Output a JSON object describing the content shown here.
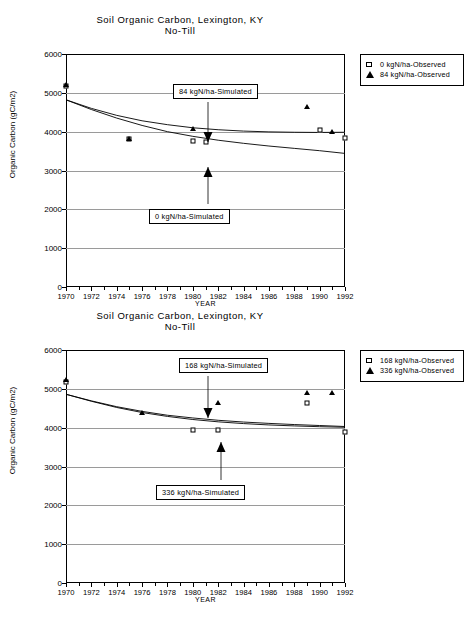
{
  "charts": [
    {
      "id": "chart-1",
      "title_line1": "Soil Organic Carbon,  Lexington,  KY",
      "title_line2": "No-Till",
      "legend": [
        {
          "key": "square",
          "label": "0 kgN/ha-Observed"
        },
        {
          "key": "triangle",
          "label": "84 kgN/ha-Observed"
        }
      ],
      "annotations": [
        {
          "text": "84 kgN/ha-Simulated",
          "direction": "down"
        },
        {
          "text": "0 kgN/ha-Simulated",
          "direction": "up"
        }
      ],
      "chart_data": {
        "type": "line",
        "title": "Soil Organic Carbon,  Lexington,  KY No-Till",
        "xlabel": "YEAR",
        "ylabel": "Organic Carbon (gC/m2)",
        "xlim": [
          1970,
          1992
        ],
        "ylim": [
          0,
          6000
        ],
        "yticks": [
          0,
          1000,
          2000,
          3000,
          4000,
          5000,
          6000
        ],
        "xticks": [
          1970,
          1972,
          1974,
          1976,
          1978,
          1980,
          1982,
          1984,
          1986,
          1988,
          1990,
          1992
        ],
        "grid": true,
        "legend_position": "right-outside",
        "series": [
          {
            "name": "84 kgN/ha-Simulated",
            "type": "line",
            "x": [
              1970,
              1972,
              1974,
              1976,
              1978,
              1980,
              1982,
              1984,
              1986,
              1988,
              1990,
              1992
            ],
            "values": [
              4820,
              4600,
              4420,
              4280,
              4180,
              4100,
              4050,
              4015,
              3995,
              3985,
              3980,
              3985
            ]
          },
          {
            "name": "0 kgN/ha-Simulated",
            "type": "line",
            "x": [
              1970,
              1972,
              1974,
              1976,
              1978,
              1980,
              1982,
              1984,
              1986,
              1988,
              1990,
              1992
            ],
            "values": [
              4820,
              4570,
              4350,
              4160,
              4000,
              3880,
              3780,
              3700,
              3630,
              3570,
              3510,
              3440
            ]
          },
          {
            "name": "0 kgN/ha-Observed",
            "type": "scatter",
            "marker": "square",
            "x": [
              1970,
              1975,
              1980,
              1981,
              1990,
              1992
            ],
            "values": [
              5180,
              3800,
              3760,
              3740,
              4050,
              3830
            ]
          },
          {
            "name": "84 kgN/ha-Observed",
            "type": "scatter",
            "marker": "triangle",
            "x": [
              1970,
              1975,
              1980,
              1989,
              1991
            ],
            "values": [
              5200,
              3820,
              4080,
              4640,
              4000
            ]
          }
        ]
      }
    },
    {
      "id": "chart-2",
      "title_line1": "Soil Organic Carbon,  Lexington,  KY",
      "title_line2": "No-Till",
      "legend": [
        {
          "key": "square",
          "label": "168 kgN/ha-Observed"
        },
        {
          "key": "triangle",
          "label": "336 kgN/ha-Observed"
        }
      ],
      "annotations": [
        {
          "text": "168 kgN/ha-Simulated",
          "direction": "down"
        },
        {
          "text": "336 kgN/ha-Simulated",
          "direction": "up"
        }
      ],
      "chart_data": {
        "type": "line",
        "title": "Soil Organic Carbon,  Lexington,  KY No-Till",
        "xlabel": "YEAR",
        "ylabel": "Organic Carbon (gC/m2)",
        "xlim": [
          1970,
          1992
        ],
        "ylim": [
          0,
          6000
        ],
        "yticks": [
          0,
          1000,
          2000,
          3000,
          4000,
          5000,
          6000
        ],
        "xticks": [
          1970,
          1972,
          1974,
          1976,
          1978,
          1980,
          1982,
          1984,
          1986,
          1988,
          1990,
          1992
        ],
        "grid": true,
        "legend_position": "right-outside",
        "series": [
          {
            "name": "168 kgN/ha-Simulated",
            "type": "line",
            "x": [
              1970,
              1972,
              1974,
              1976,
              1978,
              1980,
              1982,
              1984,
              1986,
              1988,
              1990,
              1992
            ],
            "values": [
              4860,
              4680,
              4520,
              4390,
              4290,
              4210,
              4150,
              4105,
              4070,
              4045,
              4025,
              4010
            ]
          },
          {
            "name": "336 kgN/ha-Simulated",
            "type": "line",
            "x": [
              1970,
              1972,
              1974,
              1976,
              1978,
              1980,
              1982,
              1984,
              1986,
              1988,
              1990,
              1992
            ],
            "values": [
              4860,
              4690,
              4540,
              4420,
              4320,
              4250,
              4190,
              4145,
              4110,
              4080,
              4055,
              4030
            ]
          },
          {
            "name": "168 kgN/ha-Observed",
            "type": "scatter",
            "marker": "square",
            "x": [
              1970,
              1980,
              1982,
              1989,
              1992
            ],
            "values": [
              5180,
              3950,
              3940,
              4640,
              3900
            ]
          },
          {
            "name": "336 kgN/ha-Observed",
            "type": "scatter",
            "marker": "triangle",
            "x": [
              1970,
              1976,
              1982,
              1989,
              1991
            ],
            "values": [
              5220,
              4380,
              4640,
              4900,
              4880
            ]
          }
        ]
      }
    }
  ]
}
